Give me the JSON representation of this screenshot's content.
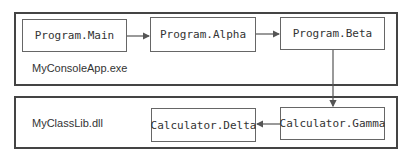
{
  "containers": [
    {
      "id": "console-app",
      "label": "MyConsoleApp.exe"
    },
    {
      "id": "class-lib",
      "label": "MyClassLib.dll"
    }
  ],
  "nodes": {
    "main": "Program.Main",
    "alpha": "Program.Alpha",
    "beta": "Program.Beta",
    "gamma": "Calculator.Gamma",
    "delta": "Calculator.Delta"
  },
  "edges": [
    {
      "from": "Program.Main",
      "to": "Program.Alpha"
    },
    {
      "from": "Program.Alpha",
      "to": "Program.Beta"
    },
    {
      "from": "Program.Beta",
      "to": "Calculator.Gamma"
    },
    {
      "from": "Calculator.Gamma",
      "to": "Calculator.Delta"
    }
  ],
  "colors": {
    "stroke": "#444444",
    "text": "#333333"
  }
}
